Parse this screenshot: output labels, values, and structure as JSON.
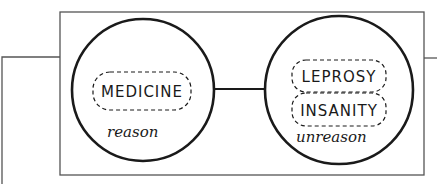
{
  "diagram": {
    "left_circle": {
      "boxes": [
        {
          "label": "MEDICINE"
        }
      ],
      "caption": "reason"
    },
    "right_circle": {
      "boxes": [
        {
          "label": "LEPROSY"
        },
        {
          "label": "INSANITY"
        }
      ],
      "caption": "unreason"
    }
  },
  "colors": {
    "ink": "#1a1a1a",
    "frame": "#555555",
    "background": "#ffffff"
  }
}
